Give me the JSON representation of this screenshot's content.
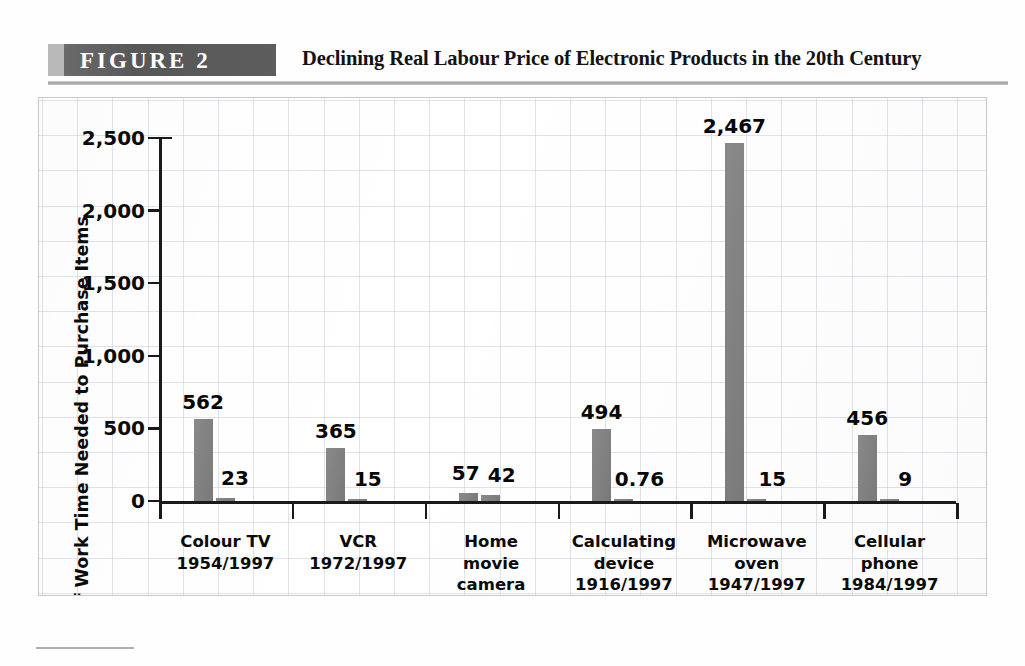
{
  "figure": {
    "banner_label": "FIGURE  2",
    "title": "Declining Real Labour Price of Electronic Products in the 20th Century",
    "banner_color": "#5a5a5a",
    "bar_color": "#808080"
  },
  "chart_data": {
    "type": "bar",
    "title": "Declining Real Labour Price of Electronic Products in the 20th Century",
    "xlabel": "",
    "ylabel": "Hours of Work Time Needed to Purchase Items",
    "ylim": [
      0,
      2500
    ],
    "yticks": [
      0,
      500,
      1000,
      1500,
      2000,
      2500
    ],
    "ytick_labels": [
      "0",
      "500",
      "1,000",
      "1,500",
      "2,000",
      "2,500"
    ],
    "grid": true,
    "legend": "none",
    "categories": [
      "Colour TV\n1954/1997",
      "VCR\n1972/1997",
      "Home\nmovie\ncamera\n1960/1997",
      "Calculating\ndevice\n1916/1997",
      "Microwave\noven\n1947/1997",
      "Cellular\nphone\n1984/1997"
    ],
    "series": [
      {
        "name": "Earlier year",
        "values": [
          562,
          365,
          57,
          494,
          2467,
          456
        ],
        "value_labels": [
          "562",
          "365",
          "57",
          "494",
          "2,467",
          "456"
        ]
      },
      {
        "name": "1997",
        "values": [
          23,
          15,
          42,
          0.76,
          15,
          9
        ],
        "value_labels": [
          "23",
          "15",
          "42",
          "0.76",
          "15",
          "9"
        ]
      }
    ]
  },
  "bars": [
    {
      "label": "562",
      "value": 562,
      "group": 0,
      "series": 0
    },
    {
      "label": "23",
      "value": 23,
      "group": 0,
      "series": 1
    },
    {
      "label": "365",
      "value": 365,
      "group": 1,
      "series": 0
    },
    {
      "label": "15",
      "value": 15,
      "group": 1,
      "series": 1
    },
    {
      "label": "57",
      "value": 57,
      "group": 2,
      "series": 0
    },
    {
      "label": "42",
      "value": 42,
      "group": 2,
      "series": 1
    },
    {
      "label": "494",
      "value": 494,
      "group": 3,
      "series": 0
    },
    {
      "label": "0.76",
      "value": 0.76,
      "group": 3,
      "series": 1
    },
    {
      "label": "2,467",
      "value": 2467,
      "group": 4,
      "series": 0
    },
    {
      "label": "15",
      "value": 15,
      "group": 4,
      "series": 1
    },
    {
      "label": "456",
      "value": 456,
      "group": 5,
      "series": 0
    },
    {
      "label": "9",
      "value": 9,
      "group": 5,
      "series": 1
    }
  ]
}
